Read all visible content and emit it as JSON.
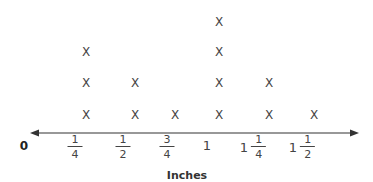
{
  "chart_data": {
    "type": "line-plot (dot plot)",
    "title": "",
    "xlabel": "Inches",
    "ylabel": "",
    "marker": "X",
    "origin_label": "0",
    "categories": [
      "1/4",
      "1/2",
      "3/4",
      "1",
      "1 1/4",
      "1 1/2"
    ],
    "values": [
      3,
      2,
      1,
      4,
      2,
      1
    ],
    "tick_labels": [
      {
        "whole": "",
        "num": "1",
        "den": "4"
      },
      {
        "whole": "",
        "num": "1",
        "den": "2"
      },
      {
        "whole": "",
        "num": "3",
        "den": "4"
      },
      {
        "whole": "1",
        "num": "",
        "den": ""
      },
      {
        "whole": "1",
        "num": "1",
        "den": "4"
      },
      {
        "whole": "1",
        "num": "1",
        "den": "2"
      }
    ],
    "axis": {
      "arrows": "both",
      "grid": false
    }
  },
  "labels": {
    "zero": "0",
    "xlabel": "Inches",
    "marker": "X"
  },
  "colors": {
    "axis": "#333333",
    "marker": "#444444",
    "text": "#222222"
  }
}
